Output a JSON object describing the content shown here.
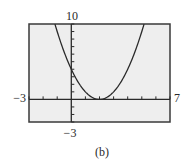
{
  "chart_data": {
    "type": "line",
    "title": "",
    "caption": "(b)",
    "xlabel": "",
    "ylabel": "",
    "xlim": [
      -3,
      7
    ],
    "ylim": [
      -3,
      10
    ],
    "xscale_tick": 1,
    "yscale_tick": 1,
    "grid": false,
    "window_labels": {
      "xmin": "−3",
      "xmax": "7",
      "ymin": "−3",
      "ymax": "10"
    },
    "series": [
      {
        "name": "parabola",
        "equation": "y = (x − 2)^2",
        "x": [
          -1.16,
          -1,
          0,
          1,
          2,
          3,
          4,
          5,
          5.16
        ],
        "y": [
          10,
          9,
          4,
          1,
          0,
          1,
          4,
          9,
          10
        ]
      }
    ],
    "vertex": [
      2,
      0
    ],
    "y_intercept": 4,
    "colors": {
      "plot_background": "#eeeeee",
      "frame": "#3a3a3a",
      "curve": "#2a2a2a",
      "axes": "#2a2a2a"
    }
  }
}
